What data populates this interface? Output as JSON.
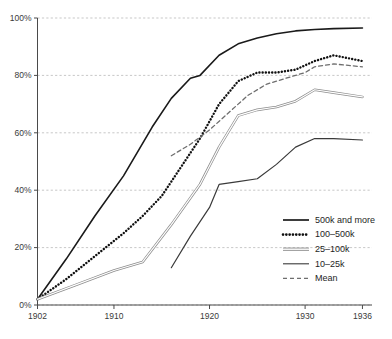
{
  "chart_data": {
    "type": "line",
    "title": "",
    "subtitle": "",
    "xlabel": "",
    "ylabel": "",
    "xlim": [
      1902,
      1937
    ],
    "ylim": [
      0,
      100
    ],
    "grid": true,
    "grid_axis": "y",
    "legend_position": "bottom-right",
    "x_ticks": [
      1902,
      1910,
      1920,
      1930,
      1936
    ],
    "x_tick_labels": [
      "1902",
      "1910",
      "1920",
      "1930",
      "1936"
    ],
    "y_ticks": [
      0,
      20,
      40,
      60,
      80,
      100
    ],
    "y_tick_labels": [
      "0%",
      "20%",
      "40%",
      "60%",
      "80%",
      "100%"
    ],
    "series": [
      {
        "name": "500k and more",
        "style": "solid",
        "color": "#1a1a1a",
        "width": 1.6,
        "x": [
          1902,
          1905,
          1908,
          1911,
          1914,
          1916,
          1918,
          1919,
          1921,
          1923,
          1925,
          1927,
          1929,
          1931,
          1933,
          1936
        ],
        "y": [
          2,
          16,
          31,
          45,
          62,
          72,
          79,
          80,
          87,
          91,
          93,
          94.5,
          95.5,
          96,
          96.3,
          96.5
        ]
      },
      {
        "name": "100–500k",
        "style": "dotted",
        "color": "#111111",
        "width": 2.4,
        "x": [
          1902,
          1905,
          1908,
          1911,
          1913,
          1915,
          1917,
          1919,
          1921,
          1923,
          1925,
          1927,
          1929,
          1931,
          1933,
          1936
        ],
        "y": [
          2,
          9,
          17,
          25,
          31,
          38,
          48,
          58,
          70,
          78,
          81,
          81,
          82,
          85,
          87,
          85
        ]
      },
      {
        "name": "25–100k",
        "style": "double",
        "color": "#8d8d8d",
        "width": 2.6,
        "x": [
          1902,
          1906,
          1910,
          1913,
          1916,
          1919,
          1921,
          1923,
          1925,
          1927,
          1929,
          1931,
          1933,
          1936
        ],
        "y": [
          2,
          7,
          12,
          15,
          28,
          42,
          55,
          66,
          68,
          69,
          71,
          75,
          74,
          72.5
        ]
      },
      {
        "name": "10–25k",
        "style": "solid",
        "color": "#3a3a3a",
        "width": 1.2,
        "x": [
          1916,
          1918,
          1920,
          1921,
          1923,
          1925,
          1927,
          1929,
          1931,
          1933,
          1936
        ],
        "y": [
          13,
          24,
          34,
          42,
          43,
          44,
          49,
          55,
          58,
          58,
          57.5
        ]
      },
      {
        "name": "Mean",
        "style": "dashed",
        "color": "#6e6e6e",
        "width": 1.3,
        "x": [
          1916,
          1918,
          1920,
          1922,
          1924,
          1926,
          1928,
          1930,
          1931,
          1933,
          1936
        ],
        "y": [
          52,
          56,
          61,
          67,
          73,
          77,
          79,
          81,
          83,
          84,
          83
        ]
      }
    ]
  },
  "legend": {
    "items": [
      {
        "label": "500k and more",
        "swatch": "solid-thick"
      },
      {
        "label": "100–500k",
        "swatch": "dotted"
      },
      {
        "label": "25–100k",
        "swatch": "double-gray"
      },
      {
        "label": "10–25k",
        "swatch": "solid-thin"
      },
      {
        "label": "Mean",
        "swatch": "dashed"
      }
    ]
  },
  "colors": {
    "grid": "#b9b9b9",
    "axis": "#4a4a4a",
    "text": "#2b2b2b",
    "background": "#ffffff"
  }
}
